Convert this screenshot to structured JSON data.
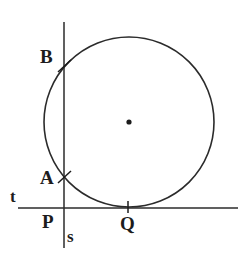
{
  "figure": {
    "width": 246,
    "height": 254,
    "background_color": "#ffffff",
    "stroke_color": "#2b2b2b"
  },
  "labels": {
    "point_b": "B",
    "point_a": "A",
    "point_p": "P",
    "point_q": "Q",
    "line_t": "t",
    "line_s": "s"
  },
  "chart_data": {
    "type": "scatter",
    "xlabel": "",
    "ylabel": "",
    "xlim": [
      0,
      246
    ],
    "ylim": [
      254,
      0
    ],
    "grid": false,
    "legend": "none",
    "circle": {
      "center_x": 129,
      "center_y": 122,
      "radius": 85,
      "stroke": "#2b2b2b",
      "stroke_width": 1.6,
      "fill": "none"
    },
    "center_dot": {
      "x": 129,
      "y": 122,
      "radius": 2.6,
      "color": "#1c1c1c"
    },
    "lines": [
      {
        "name": "t",
        "role": "tangent-line",
        "x1": 18,
        "y1": 208,
        "x2": 238,
        "y2": 208,
        "stroke": "#2b2b2b",
        "stroke_width": 1.5
      },
      {
        "name": "s",
        "role": "secant-line",
        "x1": 64,
        "y1": 22,
        "x2": 64,
        "y2": 248,
        "stroke": "#2b2b2b",
        "stroke_width": 1.5
      }
    ],
    "points": [
      {
        "label": "B",
        "x": 64,
        "y": 66,
        "role": "secant-circle-upper-intersection",
        "tick": "diagonal"
      },
      {
        "label": "A",
        "x": 64,
        "y": 177,
        "role": "secant-circle-lower-intersection",
        "tick": "diagonal"
      },
      {
        "label": "P",
        "x": 64,
        "y": 208,
        "role": "secant-tangent-intersection",
        "tick": "none"
      },
      {
        "label": "Q",
        "x": 128,
        "y": 207,
        "role": "tangent-point",
        "tick": "vertical"
      }
    ],
    "ticks": [
      {
        "at": "B",
        "x1": 58,
        "y1": 72,
        "x2": 71,
        "y2": 60
      },
      {
        "at": "A",
        "x1": 58,
        "y1": 183,
        "x2": 71,
        "y2": 171
      },
      {
        "at": "Q",
        "x1": 128,
        "y1": 201,
        "x2": 128,
        "y2": 213
      }
    ]
  }
}
